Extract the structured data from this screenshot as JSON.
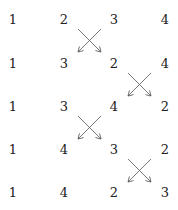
{
  "columns_x": [
    13,
    64,
    114,
    165
  ],
  "rows_y": [
    19,
    63,
    106,
    149,
    192
  ],
  "rows": [
    [
      "1",
      "2",
      "3",
      "4"
    ],
    [
      "1",
      "3",
      "2",
      "4"
    ],
    [
      "1",
      "3",
      "4",
      "2"
    ],
    [
      "1",
      "4",
      "3",
      "2"
    ],
    [
      "1",
      "4",
      "2",
      "3"
    ]
  ],
  "swaps": [
    {
      "after_row": 0,
      "between_cols": [
        1,
        2
      ]
    },
    {
      "after_row": 1,
      "between_cols": [
        2,
        3
      ]
    },
    {
      "after_row": 2,
      "between_cols": [
        1,
        2
      ]
    },
    {
      "after_row": 3,
      "between_cols": [
        2,
        3
      ]
    }
  ]
}
